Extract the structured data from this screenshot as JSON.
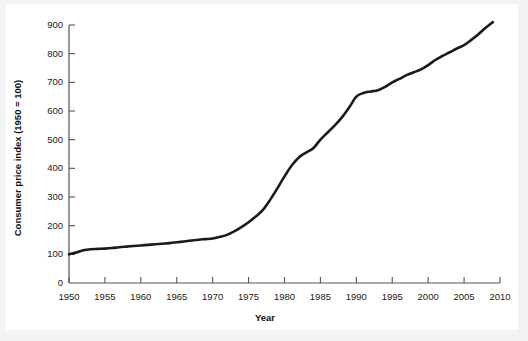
{
  "chart_data": {
    "type": "line",
    "title": "",
    "xlabel": "Year",
    "ylabel": "Consumer price index (1950 = 100)",
    "xlim": [
      1950,
      2010
    ],
    "ylim": [
      0,
      900
    ],
    "grid": false,
    "legend": null,
    "xticks": [
      1950,
      1955,
      1960,
      1965,
      1970,
      1975,
      1980,
      1985,
      1990,
      1995,
      2000,
      2005,
      2010
    ],
    "yticks": [
      0,
      100,
      200,
      300,
      400,
      500,
      600,
      700,
      800,
      900
    ],
    "xtick_labels": [
      "1950",
      "1955",
      "1960",
      "1965",
      "1970",
      "1975",
      "1980",
      "1985",
      "1990",
      "1995",
      "2000",
      "2005",
      "2010"
    ],
    "ytick_labels": [
      "0",
      "100",
      "200",
      "300",
      "400",
      "500",
      "600",
      "700",
      "800",
      "900"
    ],
    "series": [
      {
        "name": "Consumer price index",
        "color": "#1a1a1a",
        "line_width": 2.6,
        "x": [
          1950,
          1951,
          1952,
          1953,
          1954,
          1955,
          1956,
          1957,
          1958,
          1959,
          1960,
          1961,
          1962,
          1963,
          1964,
          1965,
          1966,
          1967,
          1968,
          1969,
          1970,
          1971,
          1972,
          1973,
          1974,
          1975,
          1976,
          1977,
          1978,
          1979,
          1980,
          1981,
          1982,
          1983,
          1984,
          1985,
          1986,
          1987,
          1988,
          1989,
          1990,
          1991,
          1992,
          1993,
          1994,
          1995,
          1996,
          1997,
          1998,
          1999,
          2000,
          2001,
          2002,
          2003,
          2004,
          2005,
          2006,
          2007,
          2008,
          2009
        ],
        "y": [
          100,
          106,
          114,
          118,
          119,
          120,
          122,
          125,
          127,
          129,
          131,
          133,
          135,
          137,
          139,
          142,
          145,
          148,
          151,
          153,
          155,
          161,
          168,
          180,
          195,
          212,
          232,
          255,
          290,
          330,
          372,
          410,
          438,
          455,
          470,
          500,
          525,
          550,
          578,
          612,
          650,
          663,
          668,
          672,
          684,
          700,
          712,
          725,
          735,
          745,
          760,
          778,
          792,
          805,
          818,
          830,
          848,
          868,
          890,
          910
        ]
      }
    ]
  },
  "axes": {
    "x_title": "Year",
    "y_title": "Consumer price index (1950 = 100)"
  },
  "colors": {
    "line": "#1a1a1a",
    "axis": "#555555",
    "text": "#1a1a1a",
    "plot_background": "#ffffff",
    "figure_background": "#f3f3f3"
  }
}
